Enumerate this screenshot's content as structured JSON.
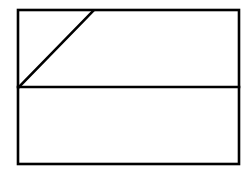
{
  "figure": {
    "background_color": "#ffffff",
    "stroke_color": "#000000",
    "canvas": {
      "width": 251,
      "height": 178
    }
  },
  "chart_data": {
    "type": "diagram",
    "xlabel": "",
    "ylabel": "",
    "grid": false,
    "legend": null,
    "annotations": [],
    "shapes": [
      {
        "name": "outer-rectangle",
        "kind": "rect",
        "x": 18,
        "y": 10,
        "width": 221,
        "height": 154,
        "stroke": "#000000",
        "stroke_width": 2.6,
        "fill": "none"
      },
      {
        "name": "horizontal-divider",
        "kind": "line",
        "x1": 18,
        "y1": 87,
        "x2": 239,
        "y2": 87,
        "stroke": "#000000",
        "stroke_width": 2.6
      },
      {
        "name": "diagonal-line",
        "kind": "line",
        "x1": 19,
        "y1": 87,
        "x2": 93,
        "y2": 11,
        "stroke": "#000000",
        "stroke_width": 2.6
      }
    ],
    "regions": [
      {
        "name": "upper-band",
        "x": 18,
        "y": 10,
        "width": 221,
        "height": 77
      },
      {
        "name": "lower-band",
        "x": 18,
        "y": 87,
        "width": 221,
        "height": 77
      }
    ]
  }
}
